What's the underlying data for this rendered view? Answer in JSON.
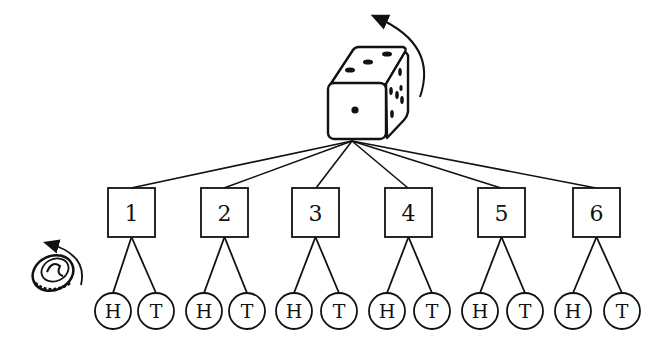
{
  "diagram": {
    "type": "tree",
    "root": {
      "name": "die",
      "label": "die roll",
      "rotation_arrow": true,
      "visible_faces": {
        "front": 1,
        "top": 3,
        "side": 6
      }
    },
    "coin": {
      "name": "coin",
      "label": "coin flip",
      "rotation_arrow": true
    },
    "die_outcomes": [
      {
        "label": "1",
        "children": [
          "H",
          "T"
        ]
      },
      {
        "label": "2",
        "children": [
          "H",
          "T"
        ]
      },
      {
        "label": "3",
        "children": [
          "H",
          "T"
        ]
      },
      {
        "label": "4",
        "children": [
          "H",
          "T"
        ]
      },
      {
        "label": "5",
        "children": [
          "H",
          "T"
        ]
      },
      {
        "label": "6",
        "children": [
          "H",
          "T"
        ]
      }
    ],
    "colors": {
      "stroke": "#111111",
      "background": "#ffffff"
    }
  }
}
